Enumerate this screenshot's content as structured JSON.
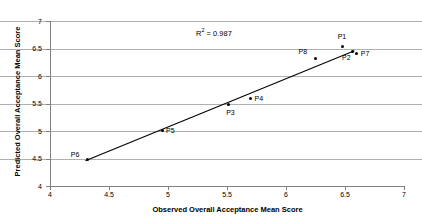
{
  "chart_data": {
    "type": "scatter",
    "title": "",
    "xlabel": "Observed Overall Acceptance Mean Score",
    "ylabel": "Predicted Overall Acceptance Mean Score",
    "xlim": [
      4,
      7
    ],
    "ylim": [
      4,
      7
    ],
    "xticks": [
      "4",
      "4.5",
      "5",
      "5.5",
      "6",
      "6.5",
      "7"
    ],
    "yticks": [
      "4",
      "4.5",
      "5",
      "5.5",
      "6",
      "6.5",
      "7"
    ],
    "xtick_values": [
      4,
      4.5,
      5,
      5.5,
      6,
      6.5,
      7
    ],
    "ytick_values": [
      4,
      4.5,
      5,
      5.5,
      6,
      6.5,
      7
    ],
    "grid": "horizontal",
    "legend": "none",
    "annotations": [
      {
        "text": "R2 = 0.987",
        "r_symbol": "R",
        "superscript": "2",
        "equals": " = 0.987",
        "x": 5.65,
        "y": 6.78
      }
    ],
    "points": [
      {
        "label": "P6",
        "x": 4.32,
        "y": 4.48,
        "label_pos": "left"
      },
      {
        "label": "P5",
        "x": 4.95,
        "y": 5.01,
        "label_pos": "right"
      },
      {
        "label": "P3",
        "x": 5.51,
        "y": 5.48,
        "label_pos": "below-right"
      },
      {
        "label": "P4",
        "x": 5.7,
        "y": 5.6,
        "label_pos": "right"
      },
      {
        "label": "P8",
        "x": 6.25,
        "y": 6.32,
        "label_pos": "above-left"
      },
      {
        "label": "P1",
        "x": 6.48,
        "y": 6.53,
        "label_pos": "above"
      },
      {
        "label": "P2",
        "x": 6.56,
        "y": 6.45,
        "label_pos": "below-left"
      },
      {
        "label": "P7",
        "x": 6.6,
        "y": 6.41,
        "label_pos": "right"
      }
    ],
    "trendline": {
      "type": "linear-fit",
      "x_start": 4.3,
      "y_start": 4.46,
      "x_end": 6.58,
      "y_end": 6.46,
      "r_squared": 0.987,
      "color": "#000000"
    },
    "series": [
      {
        "name": "Predicted vs Observed",
        "x": [
          4.32,
          4.95,
          5.51,
          5.7,
          6.25,
          6.48,
          6.56,
          6.6
        ],
        "values": [
          4.48,
          5.01,
          5.48,
          5.6,
          6.32,
          6.53,
          6.45,
          6.41
        ]
      }
    ]
  },
  "colors": {
    "grid": "#b0b0b0",
    "axis": "#808080",
    "marker": "#000000",
    "text": "#000000",
    "background": "#ffffff"
  }
}
